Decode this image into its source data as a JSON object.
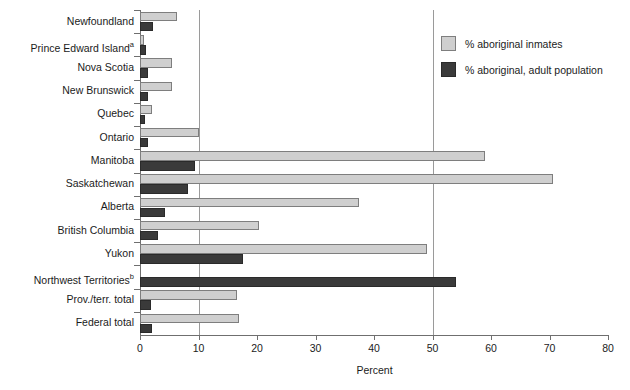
{
  "chart_data": {
    "type": "bar",
    "orientation": "horizontal",
    "title": "",
    "xlabel": "Percent",
    "ylabel": "",
    "xlim": [
      0,
      80
    ],
    "xticks": [
      0,
      10,
      20,
      30,
      40,
      50,
      60,
      70,
      80
    ],
    "xtick_labels": [
      "0",
      "10",
      "20",
      "30",
      "40",
      "50",
      "60",
      "70",
      "80"
    ],
    "grid": "vertical gridlines at 10 and 50",
    "gridlines": [
      10,
      50
    ],
    "legend_position": "top-right inside plot",
    "categories": [
      "Newfoundland",
      "Prince Edward Island",
      "Nova Scotia",
      "New Brunswick",
      "Quebec",
      "Ontario",
      "Manitoba",
      "Saskatchewan",
      "Alberta",
      "British Columbia",
      "Yukon",
      "Northwest Territories",
      "Prov./terr. total",
      "Federal total"
    ],
    "category_footnotes": [
      "",
      "a",
      "",
      "",
      "",
      "",
      "",
      "",
      "",
      "",
      "",
      "b",
      "",
      ""
    ],
    "series": [
      {
        "name": "% aboriginal inmates",
        "color": "#cfcfcf",
        "values": [
          6.3,
          0.7,
          5.4,
          5.4,
          2.1,
          10.1,
          59.0,
          70.6,
          37.4,
          20.3,
          49.0,
          0.0,
          16.5,
          17.0
        ]
      },
      {
        "name": "% aboriginal, adult population",
        "color": "#3a3a3a",
        "values": [
          2.2,
          1.0,
          1.4,
          1.3,
          0.9,
          1.3,
          9.4,
          8.2,
          4.3,
          3.1,
          17.6,
          54.0,
          1.9,
          2.0
        ]
      }
    ]
  },
  "legend": {
    "entries": [
      {
        "label": "% aboriginal inmates",
        "swatch": "light"
      },
      {
        "label": "% aboriginal, adult population",
        "swatch": "dark"
      }
    ]
  },
  "axis": {
    "x_title": "Percent"
  }
}
